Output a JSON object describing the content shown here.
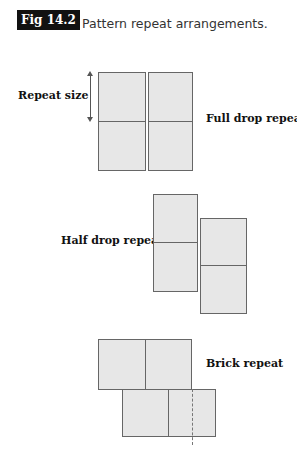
{
  "figure": {
    "badge": "Fig 14.2",
    "caption": "Pattern repeat arrangements."
  },
  "labels": {
    "repeat_size": "Repeat size",
    "full_drop": "Full drop repeat",
    "half_drop": "Half drop repeat",
    "brick": "Brick repeat"
  },
  "colors": {
    "tile_fill": "#e7e7e7",
    "tile_border": "#666666",
    "badge_bg": "#111111"
  }
}
